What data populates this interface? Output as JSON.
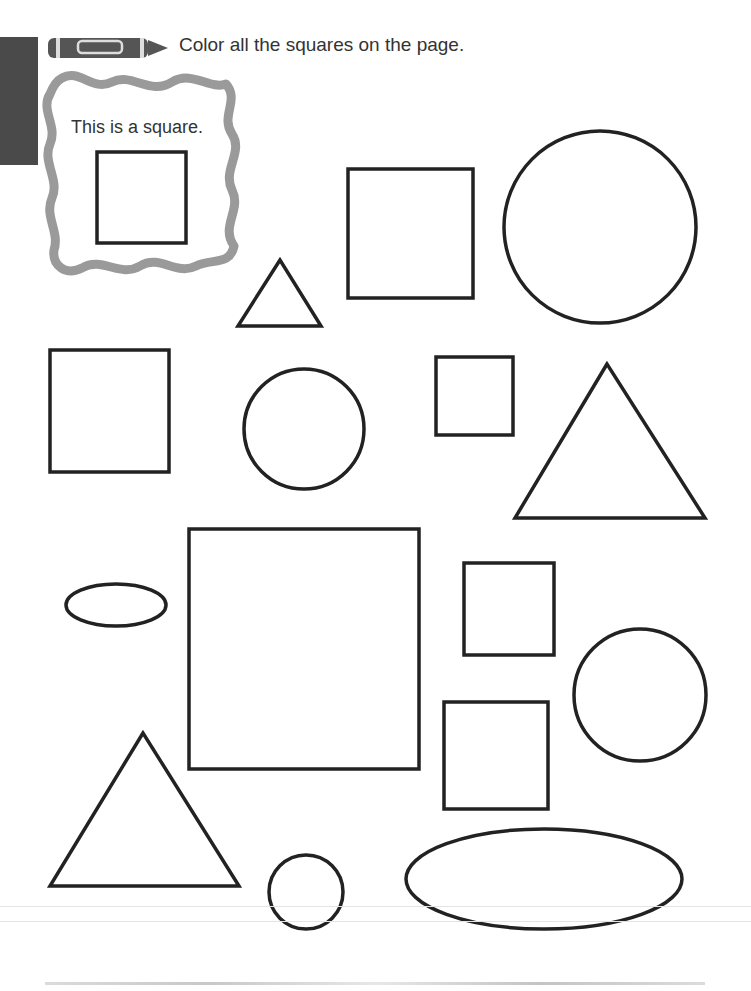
{
  "header": {
    "instruction": "Color all the squares on the page.",
    "icon": "crayon-icon"
  },
  "example": {
    "label": "This is a square.",
    "frame_style": "wavy-gray-border"
  },
  "colors": {
    "tab": "#4a4a4a",
    "frame": "#9a9a9a",
    "stroke": "#222222",
    "text": "#333333"
  },
  "shapes": [
    {
      "type": "square",
      "x": 97,
      "y": 152,
      "w": 89,
      "h": 91,
      "example": true
    },
    {
      "type": "triangle",
      "points": "280,260 238,326 321,326"
    },
    {
      "type": "square",
      "x": 348,
      "y": 169,
      "w": 125,
      "h": 129
    },
    {
      "type": "circle",
      "cx": 600,
      "cy": 227,
      "r": 96
    },
    {
      "type": "square",
      "x": 50,
      "y": 350,
      "w": 119,
      "h": 122
    },
    {
      "type": "circle",
      "cx": 304,
      "cy": 429,
      "r": 60
    },
    {
      "type": "square",
      "x": 436,
      "y": 357,
      "w": 77,
      "h": 78
    },
    {
      "type": "triangle",
      "points": "607,364 515,518 705,518"
    },
    {
      "type": "ellipse",
      "cx": 116,
      "cy": 605,
      "rx": 50,
      "ry": 21
    },
    {
      "type": "square",
      "x": 189,
      "y": 529,
      "w": 230,
      "h": 240
    },
    {
      "type": "square",
      "x": 464,
      "y": 563,
      "w": 90,
      "h": 92
    },
    {
      "type": "circle",
      "cx": 640,
      "cy": 695,
      "r": 66
    },
    {
      "type": "square",
      "x": 444,
      "y": 702,
      "w": 104,
      "h": 107
    },
    {
      "type": "triangle",
      "points": "143,733 50,886 239,886"
    },
    {
      "type": "circle",
      "cx": 306,
      "cy": 892,
      "r": 37
    },
    {
      "type": "ellipse",
      "cx": 544,
      "cy": 879,
      "rx": 138,
      "ry": 50
    }
  ]
}
